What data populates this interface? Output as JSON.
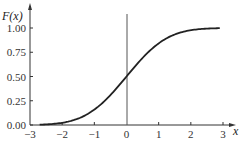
{
  "chart_data": {
    "type": "line",
    "title": "",
    "xlabel": "x",
    "ylabel": "F(x)",
    "xlim": [
      -3,
      3
    ],
    "ylim": [
      0,
      1
    ],
    "x_ticks": [
      "-3",
      "-2",
      "-1",
      "0",
      "1",
      "2",
      "3"
    ],
    "y_ticks": [
      "0.00",
      "0.25",
      "0.50",
      "0.75",
      "1.00"
    ],
    "grid": false,
    "series": [
      {
        "name": "F(x) standard normal CDF",
        "x": [
          -2.7,
          -2.5,
          -2,
          -1.5,
          -1,
          -0.5,
          0,
          0.5,
          1,
          1.5,
          2,
          2.5,
          2.9
        ],
        "values": [
          0.003,
          0.006,
          0.023,
          0.067,
          0.159,
          0.309,
          0.5,
          0.691,
          0.841,
          0.933,
          0.977,
          0.994,
          0.998
        ]
      }
    ],
    "color": "#222222"
  }
}
